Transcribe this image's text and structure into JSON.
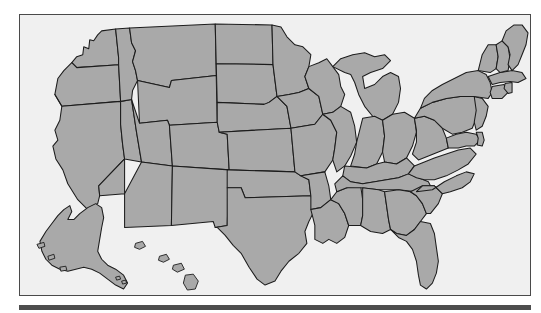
{
  "document": {
    "type": "map-figure",
    "title": "United States map",
    "description": "Outline map of the United States with state boundaries, shaded gray, including Alaska and Hawaii insets",
    "projection": "flat inset layout"
  },
  "figure": {
    "frame": {
      "border_color": "#4a4a4a",
      "background_color": "#f0f0f0",
      "x": 19,
      "y": 14,
      "width": 512,
      "height": 282
    },
    "rule": {
      "name": "bottom-rule",
      "color": "#4d4d4d",
      "x": 19,
      "y": 305,
      "width": 512,
      "height": 5
    }
  },
  "map": {
    "fill_color": "#a9a9a9",
    "stroke_color": "#1c1c1c",
    "region_count": 50,
    "regions": [
      {
        "code": "WA",
        "name": "Washington",
        "group": "west"
      },
      {
        "code": "OR",
        "name": "Oregon",
        "group": "west"
      },
      {
        "code": "CA",
        "name": "California",
        "group": "west"
      },
      {
        "code": "NV",
        "name": "Nevada",
        "group": "west"
      },
      {
        "code": "ID",
        "name": "Idaho",
        "group": "west"
      },
      {
        "code": "MT",
        "name": "Montana",
        "group": "west"
      },
      {
        "code": "WY",
        "name": "Wyoming",
        "group": "west"
      },
      {
        "code": "UT",
        "name": "Utah",
        "group": "west"
      },
      {
        "code": "AZ",
        "name": "Arizona",
        "group": "southwest"
      },
      {
        "code": "CO",
        "name": "Colorado",
        "group": "west"
      },
      {
        "code": "NM",
        "name": "New Mexico",
        "group": "southwest"
      },
      {
        "code": "ND",
        "name": "North Dakota",
        "group": "midwest"
      },
      {
        "code": "SD",
        "name": "South Dakota",
        "group": "midwest"
      },
      {
        "code": "NE",
        "name": "Nebraska",
        "group": "midwest"
      },
      {
        "code": "KS",
        "name": "Kansas",
        "group": "midwest"
      },
      {
        "code": "OK",
        "name": "Oklahoma",
        "group": "south"
      },
      {
        "code": "TX",
        "name": "Texas",
        "group": "south"
      },
      {
        "code": "MN",
        "name": "Minnesota",
        "group": "midwest"
      },
      {
        "code": "IA",
        "name": "Iowa",
        "group": "midwest"
      },
      {
        "code": "MO",
        "name": "Missouri",
        "group": "midwest"
      },
      {
        "code": "AR",
        "name": "Arkansas",
        "group": "south"
      },
      {
        "code": "LA",
        "name": "Louisiana",
        "group": "south"
      },
      {
        "code": "WI",
        "name": "Wisconsin",
        "group": "midwest"
      },
      {
        "code": "IL",
        "name": "Illinois",
        "group": "midwest"
      },
      {
        "code": "MS",
        "name": "Mississippi",
        "group": "south"
      },
      {
        "code": "MI",
        "name": "Michigan",
        "group": "midwest"
      },
      {
        "code": "IN",
        "name": "Indiana",
        "group": "midwest"
      },
      {
        "code": "OH",
        "name": "Ohio",
        "group": "midwest"
      },
      {
        "code": "KY",
        "name": "Kentucky",
        "group": "south"
      },
      {
        "code": "TN",
        "name": "Tennessee",
        "group": "south"
      },
      {
        "code": "AL",
        "name": "Alabama",
        "group": "south"
      },
      {
        "code": "GA",
        "name": "Georgia",
        "group": "south"
      },
      {
        "code": "FL",
        "name": "Florida",
        "group": "south"
      },
      {
        "code": "SC",
        "name": "South Carolina",
        "group": "south"
      },
      {
        "code": "NC",
        "name": "North Carolina",
        "group": "south"
      },
      {
        "code": "VA",
        "name": "Virginia",
        "group": "south"
      },
      {
        "code": "WV",
        "name": "West Virginia",
        "group": "south"
      },
      {
        "code": "MD",
        "name": "Maryland",
        "group": "northeast"
      },
      {
        "code": "DE",
        "name": "Delaware",
        "group": "northeast"
      },
      {
        "code": "PA",
        "name": "Pennsylvania",
        "group": "northeast"
      },
      {
        "code": "NJ",
        "name": "New Jersey",
        "group": "northeast"
      },
      {
        "code": "NY",
        "name": "New York",
        "group": "northeast"
      },
      {
        "code": "CT",
        "name": "Connecticut",
        "group": "northeast"
      },
      {
        "code": "RI",
        "name": "Rhode Island",
        "group": "northeast"
      },
      {
        "code": "MA",
        "name": "Massachusetts",
        "group": "northeast"
      },
      {
        "code": "VT",
        "name": "Vermont",
        "group": "northeast"
      },
      {
        "code": "NH",
        "name": "New Hampshire",
        "group": "northeast"
      },
      {
        "code": "ME",
        "name": "Maine",
        "group": "northeast"
      },
      {
        "code": "AK",
        "name": "Alaska",
        "group": "inset"
      },
      {
        "code": "HI",
        "name": "Hawaii",
        "group": "inset"
      }
    ]
  }
}
